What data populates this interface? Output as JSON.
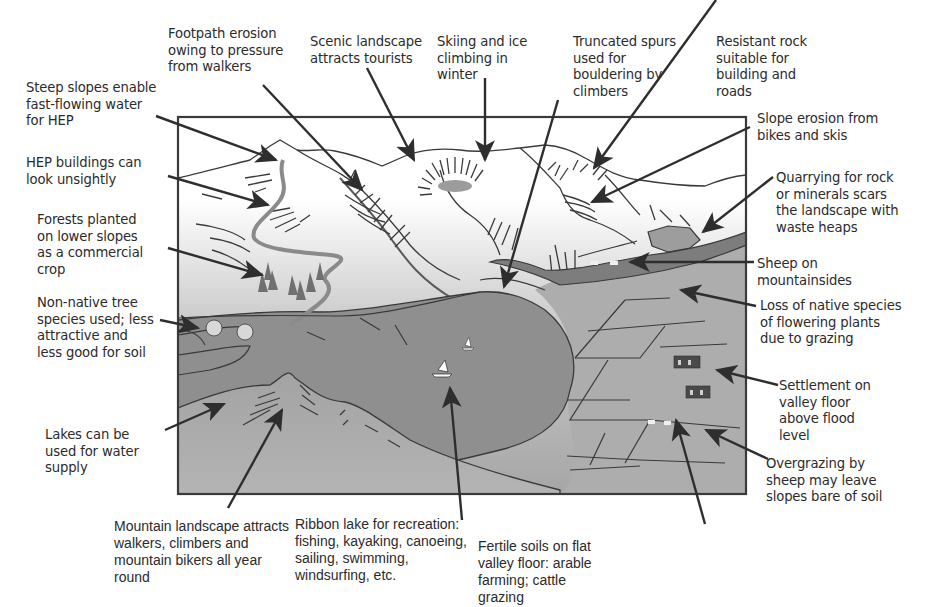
{
  "diagram": {
    "type": "annotated-illustration",
    "colors": {
      "frame": "#3a3a3a",
      "sky_top": "#ffffff",
      "mountain_gradient_bottom": "#9a9a9a",
      "valley_floor": "#a9a9a9",
      "lake": "#8f8f8f",
      "river": "#7d7d7d",
      "arrows": "#2e2e2e",
      "text": "#2b2b2b"
    },
    "labels": {
      "footpath_erosion": "Footpath erosion\nowing to pressure\nfrom walkers",
      "scenic_landscape": "Scenic landscape\nattracts tourists",
      "skiing": "Skiing and ice\nclimbing in\nwinter",
      "truncated_spurs": "Truncated spurs\nused for\nbouldering by\nclimbers",
      "resistant_rock": "Resistant rock\nsuitable for\nbuilding and\nroads",
      "steep_slopes": "Steep slopes enable\nfast-flowing water\nfor HEP",
      "slope_erosion": "Slope erosion from\nbikes and skis",
      "hep_buildings": "HEP buildings can\nlook unsightly",
      "quarrying": "Quarrying for rock\nor minerals scars\nthe landscape with\nwaste heaps",
      "forests": "Forests planted\non lower slopes\nas a commercial\ncrop",
      "sheep": "Sheep on\nmountainsides",
      "non_native": "Non-native tree\nspecies used; less\nattractive and\nless good for soil",
      "loss_native": "Loss of native species\nof flowering plants\ndue to grazing",
      "settlement": "Settlement on\nvalley floor\nabove flood\nlevel",
      "lakes_water": "Lakes can be\nused for water\nsupply",
      "overgrazing": "Overgrazing by\nsheep may leave\nslopes bare of soil",
      "mountain_landscape": "Mountain landscape attracts\nwalkers, climbers and\nmountain bikers all year\nround",
      "ribbon_lake": "Ribbon lake for recreation:\nfishing, kayaking, canoeing,\nsailing, swimming,\nwindsurfing, etc.",
      "fertile_soils": "Fertile soils on flat\nvalley floor: arable\nfarming; cattle\ngrazing"
    }
  }
}
